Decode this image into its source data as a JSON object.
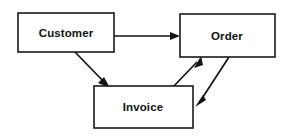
{
  "diagram": {
    "type": "entity-relationship-flow",
    "title": "",
    "background_color": "#ffffff",
    "stroke_color": "#141414",
    "text_color": "#111111",
    "nodes": [
      {
        "id": "customer",
        "label": "Customer",
        "x": 18,
        "y": 13,
        "width": 96,
        "height": 39,
        "label_x": 66,
        "label_y": 33
      },
      {
        "id": "order",
        "label": "Order",
        "x": 180,
        "y": 14,
        "width": 95,
        "height": 43,
        "label_x": 227,
        "label_y": 36
      },
      {
        "id": "invoice",
        "label": "Invoice",
        "x": 94,
        "y": 86,
        "width": 99,
        "height": 42,
        "label_x": 143,
        "label_y": 107
      }
    ],
    "edges": [
      {
        "id": "customer-to-order",
        "from": "customer",
        "to": "order",
        "label": "",
        "style": "straight-horizontal",
        "x1": 114,
        "y1": 36,
        "x2": 180,
        "y2": 36
      },
      {
        "id": "customer-to-invoice",
        "from": "customer",
        "to": "invoice",
        "label": "",
        "style": "diagonal-down-right",
        "x1": 75,
        "y1": 52,
        "x2": 109,
        "y2": 87
      },
      {
        "id": "invoice-to-order",
        "from": "invoice",
        "to": "order",
        "label": "",
        "style": "diagonal-up-right",
        "x1": 172,
        "y1": 87,
        "x2": 201,
        "y2": 57
      },
      {
        "id": "order-to-invoice",
        "from": "order",
        "to": "invoice",
        "label": "",
        "style": "diagonal-down-left",
        "x1": 229,
        "y1": 57,
        "x2": 196,
        "y2": 106
      }
    ]
  }
}
